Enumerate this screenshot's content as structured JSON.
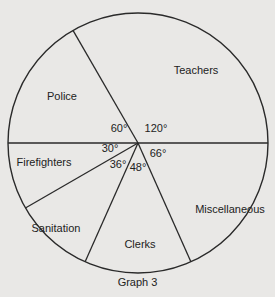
{
  "chart_data": {
    "type": "pie",
    "title": "",
    "caption": "Graph 3",
    "center": [
      138,
      143
    ],
    "radius": 130,
    "slices": [
      {
        "label": "Teachers",
        "angle_deg": 120,
        "label_pos": [
          196,
          74
        ],
        "angle_pos": [
          156,
          132
        ]
      },
      {
        "label": "Miscellaneous",
        "angle_deg": 66,
        "label_pos": [
          230,
          213
        ],
        "angle_pos": [
          158,
          157
        ]
      },
      {
        "label": "Clerks",
        "angle_deg": 48,
        "label_pos": [
          140,
          248
        ],
        "angle_pos": [
          138,
          171
        ]
      },
      {
        "label": "Sanitation",
        "angle_deg": 36,
        "label_pos": [
          56,
          232
        ],
        "angle_pos": [
          118,
          168
        ]
      },
      {
        "label": "Firefighters",
        "angle_deg": 30,
        "label_pos": [
          44,
          166
        ],
        "angle_pos": [
          110,
          152
        ]
      },
      {
        "label": "Police",
        "angle_deg": 60,
        "label_pos": [
          62,
          100
        ],
        "angle_pos": [
          119,
          132
        ]
      }
    ],
    "boundaries_deg_from_east_ccw": [
      0,
      120,
      180,
      210,
      246,
      294
    ],
    "legend": null,
    "grid": false
  },
  "page": {
    "cut_title": "... ... ...",
    "caption": "Graph 3"
  }
}
